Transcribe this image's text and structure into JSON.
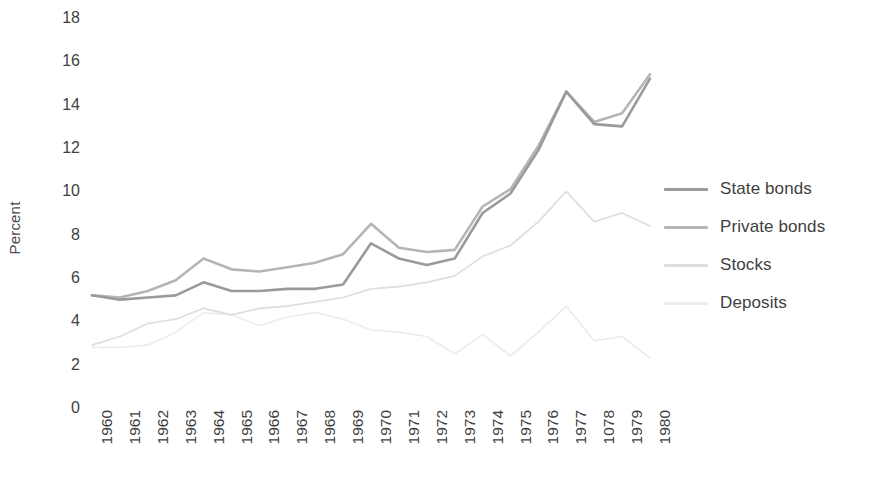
{
  "chart_data": {
    "type": "line",
    "title": "",
    "xlabel": "",
    "ylabel": "Percent",
    "ylim": [
      0,
      18
    ],
    "ytick_step": 2,
    "yticks": [
      "18",
      "16",
      "14",
      "12",
      "10",
      "8",
      "6",
      "4",
      "2",
      "0"
    ],
    "grid": false,
    "legend_position": "right",
    "categories": [
      "1960",
      "1961",
      "1962",
      "1963",
      "1964",
      "1965",
      "1966",
      "1967",
      "1968",
      "1969",
      "1970",
      "1971",
      "1972",
      "1973",
      "1974",
      "1975",
      "1976",
      "1977",
      "1078",
      "1979",
      "1980"
    ],
    "series": [
      {
        "name": "State bonds",
        "color": "#9a9a9a",
        "values": [
          5.2,
          5.0,
          5.1,
          5.2,
          5.8,
          5.4,
          5.4,
          5.5,
          5.5,
          5.7,
          7.6,
          6.9,
          6.6,
          6.9,
          9.0,
          9.9,
          11.9,
          14.6,
          13.1,
          13.0,
          15.2
        ]
      },
      {
        "name": "Private bonds",
        "color": "#b5b5b5",
        "values": [
          5.2,
          5.1,
          5.4,
          5.9,
          6.9,
          6.4,
          6.3,
          6.5,
          6.7,
          7.1,
          8.5,
          7.4,
          7.2,
          7.3,
          9.3,
          10.1,
          12.1,
          14.6,
          13.2,
          13.6,
          15.4
        ]
      },
      {
        "name": "Stocks",
        "color": "#dedede",
        "values": [
          2.9,
          3.3,
          3.9,
          4.1,
          4.6,
          4.3,
          4.6,
          4.7,
          4.9,
          5.1,
          5.5,
          5.6,
          5.8,
          6.1,
          7.0,
          7.5,
          8.6,
          10.0,
          8.6,
          9.0,
          8.4
        ]
      },
      {
        "name": "Deposits",
        "color": "#ececec",
        "values": [
          2.8,
          2.8,
          2.9,
          3.5,
          4.4,
          4.3,
          3.8,
          4.2,
          4.4,
          4.1,
          3.6,
          3.5,
          3.3,
          2.5,
          3.4,
          2.4,
          3.5,
          4.7,
          3.1,
          3.3,
          2.3
        ]
      }
    ]
  },
  "legend": {
    "items": [
      {
        "label": "State bonds"
      },
      {
        "label": "Private bonds"
      },
      {
        "label": "Stocks"
      },
      {
        "label": "Deposits"
      }
    ]
  },
  "axis": {
    "y_title": "Percent"
  }
}
